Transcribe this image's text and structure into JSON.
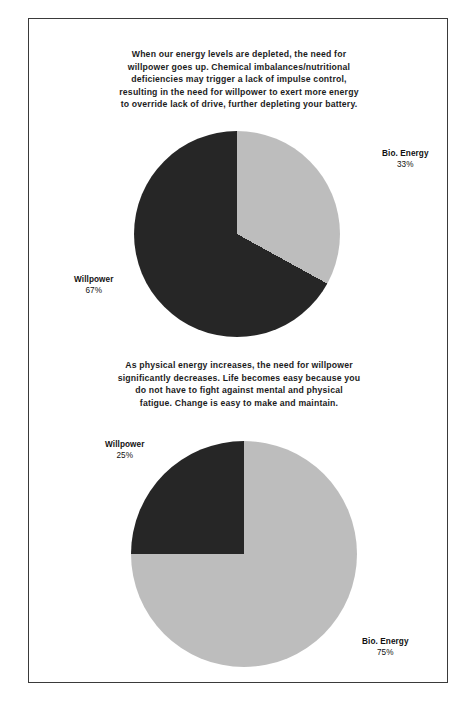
{
  "page": {
    "background": "#ffffff",
    "border_color": "#3a3a3a"
  },
  "colors": {
    "bio_energy": "#bdbdbd",
    "willpower": "#262626",
    "text": "#111111"
  },
  "sections": [
    {
      "paragraph_lines": [
        "When our energy levels are depleted, the need for",
        "willpower goes up. Chemical imbalances/nutritional",
        "deficiencies may trigger a lack of impulse control,",
        "resulting in the need for willpower to exert more energy",
        "to override lack of drive, further depleting your battery."
      ]
    },
    {
      "paragraph_lines": [
        "As physical energy increases, the need for willpower",
        "significantly decreases. Life becomes easy because you",
        "do not have to fight against mental and physical",
        "fatigue. Change is easy to make and maintain."
      ]
    }
  ],
  "labels": {
    "chart1_bio_name": "Bio. Energy",
    "chart1_bio_pct": "33%",
    "chart1_will_name": "Willpower",
    "chart1_will_pct": "67%",
    "chart2_will_name": "Willpower",
    "chart2_will_pct": "25%",
    "chart2_bio_name": "Bio. Energy",
    "chart2_bio_pct": "75%"
  },
  "chart_data": [
    {
      "type": "pie",
      "title": "Depleted energy state",
      "labels": [
        "Bio. Energy",
        "Willpower"
      ],
      "values": [
        33,
        67
      ],
      "unit": "%",
      "colors": [
        "#bdbdbd",
        "#262626"
      ],
      "start_angle_deg": 0,
      "direction": "clockwise",
      "legend": "outside-labels"
    },
    {
      "type": "pie",
      "title": "Increased physical energy state",
      "labels": [
        "Bio. Energy",
        "Willpower"
      ],
      "values": [
        75,
        25
      ],
      "unit": "%",
      "colors": [
        "#bdbdbd",
        "#262626"
      ],
      "start_angle_deg": 0,
      "direction": "clockwise",
      "legend": "outside-labels"
    }
  ]
}
